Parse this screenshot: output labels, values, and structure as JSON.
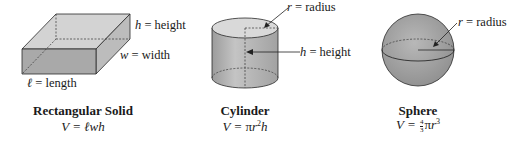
{
  "figures": [
    {
      "id": "rectangular-solid",
      "title": "Rectangular Solid",
      "formula": {
        "prefix": "V = ",
        "expr": "ℓwh"
      },
      "labels": [
        {
          "var": "h",
          "text": " = height"
        },
        {
          "var": "w",
          "text": " = width"
        },
        {
          "var": "ℓ",
          "text": " = length"
        }
      ]
    },
    {
      "id": "cylinder",
      "title": "Cylinder",
      "formula": {
        "prefix": "V = ",
        "pi": "π",
        "base": "r",
        "exp": "2",
        "suffix": "h"
      },
      "labels": [
        {
          "var": "r",
          "text": " = radius"
        },
        {
          "var": "h",
          "text": " = height"
        }
      ]
    },
    {
      "id": "sphere",
      "title": "Sphere",
      "formula": {
        "prefix": "V = ",
        "frac_num": "4",
        "frac_den": "3",
        "pi": "π",
        "base": "r",
        "exp": "3"
      },
      "labels": [
        {
          "var": "r",
          "text": " = radius"
        }
      ]
    }
  ],
  "colors": {
    "front_face": "#a9a9a9",
    "top_face": "#d6d6d6",
    "side_face": "#bdbdbd",
    "outline": "#2a2a2a",
    "cyl_top": "#d9d9d9",
    "cyl_body": "#b0b0b0",
    "sphere": "#a6a6a6"
  }
}
